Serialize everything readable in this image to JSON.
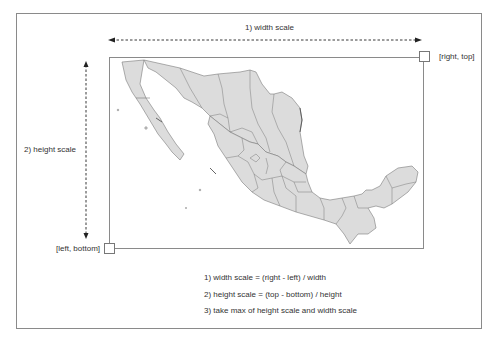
{
  "diagram": {
    "width_arrow_label": "1) width scale",
    "height_arrow_label": "2) height scale",
    "corner_top_right_label": "[right, top]",
    "corner_bottom_left_label": "[left, bottom]",
    "map_subject": "Mexico states map",
    "formulas": [
      "1) width scale = (right - left) / width",
      "2) height scale = (top - bottom) / height",
      "3) take max of height scale and width scale"
    ],
    "colors": {
      "map_fill": "#dcdcdc",
      "map_stroke": "#7a7a7a",
      "frame": "#8a8a8a",
      "arrow": "#222222"
    }
  }
}
